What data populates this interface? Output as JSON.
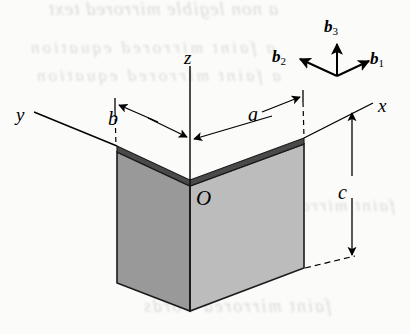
{
  "figure": {
    "kind": "engineering-line-drawing",
    "background_color": "#fbfbfa",
    "line_color": "#000000"
  },
  "axes": {
    "z": {
      "label": "z"
    },
    "y": {
      "label": "y"
    },
    "x": {
      "label": "x"
    }
  },
  "origin": {
    "label": "O"
  },
  "dimensions": [
    {
      "name": "b",
      "label": "b",
      "description": "horizontal extent of the left plate along the y direction"
    },
    {
      "name": "a",
      "label": "a",
      "description": "horizontal extent of the right plate along the x direction"
    },
    {
      "name": "c",
      "label": "c",
      "description": "vertical height of the plates"
    }
  ],
  "basis_triad": {
    "vectors": [
      {
        "name": "b1",
        "base": "b",
        "subscript": "1",
        "direction": "down-right"
      },
      {
        "name": "b2",
        "base": "b",
        "subscript": "2",
        "direction": "down-left"
      },
      {
        "name": "b3",
        "base": "b",
        "subscript": "3",
        "direction": "up"
      }
    ]
  },
  "shading": {
    "left_face_color": "#999999",
    "right_face_color": "#bcbcbc",
    "top_edge_band_color": "#4a4a4a",
    "outline_color": "#1a1a1a"
  },
  "bleed_through": {
    "line1": "a non legible mirrored text",
    "line2": "a faint mirrored equation",
    "line3": "a faint mirrored equation",
    "line4": "faint mirrored words",
    "line5": "faint mirrored words"
  }
}
